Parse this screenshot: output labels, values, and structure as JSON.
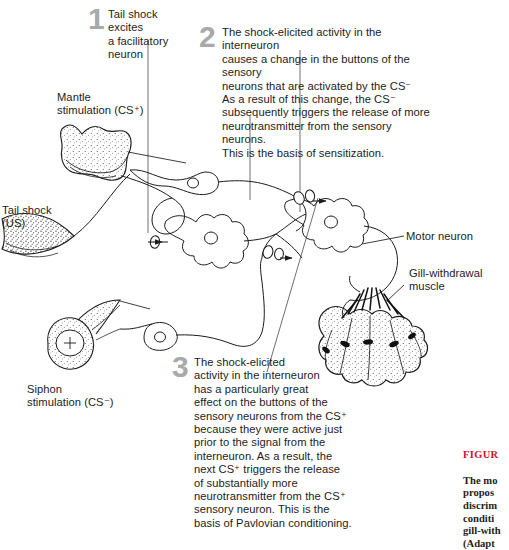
{
  "figure": {
    "background_color": "#ffffff",
    "ink_color": "#1c1c1c",
    "number_color": "#a9a9a9",
    "caption_accent_color": "#c8102e"
  },
  "steps": [
    {
      "number": "1",
      "text": "Tail shock excites\na facilitatory\nneuron"
    },
    {
      "number": "2",
      "text": "The shock-elicited activity in the interneuron\ncauses a change in the buttons of the sensory\nneurons that are activated by the CS⁻\nAs a result of this change, the CS⁻\nsubsequently triggers the release of more\nneurotransmitter from the sensory neurons.\nThis is the basis of sensitization."
    },
    {
      "number": "3",
      "text": "The shock-elicited\nactivity in the interneuron\nhas a particularly great\neffect on the buttons of the\nsensory neurons from the CS⁺\nbecause they were active just\nprior to the signal from the\ninterneuron. As a result, the\nnext CS⁺ triggers the release\nof substantially more\nneurotransmitter from the CS⁺\nsensory neuron. This is the\nbasis of Pavlovian conditioning."
    }
  ],
  "labels": {
    "mantle": "Mantle\nstimulation (CS⁺)",
    "tail_shock": "Tail shock\n(US)",
    "siphon": "Siphon\nstimulation (CS⁻)",
    "motor_neuron": "Motor neuron",
    "gill_muscle": "Gill-withdrawal\nmuscle"
  },
  "caption": {
    "figure_number": "FIGUR",
    "body": "The mo\npropos\ndiscrim\nconditi\ngill-with\n(Adapt"
  }
}
